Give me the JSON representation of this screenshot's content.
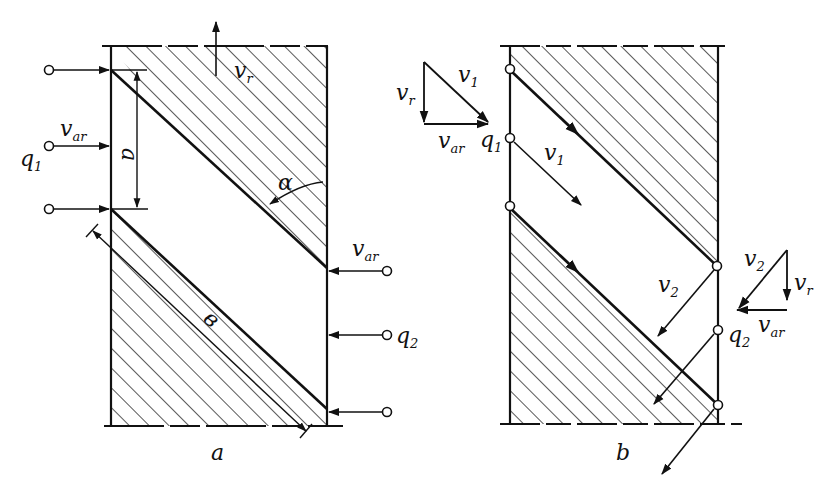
{
  "figure": {
    "panels": [
      {
        "id": "a",
        "caption": "a",
        "labels": {
          "v_r": {
            "base": "v",
            "sub": "r"
          },
          "v_ar_left": {
            "base": "v",
            "sub": "ar"
          },
          "q1": {
            "base": "q",
            "sub": "1"
          },
          "a_dim": "a",
          "alpha": "α",
          "b_dim": "в",
          "v_ar_right": {
            "base": "v",
            "sub": "ar"
          },
          "q2": {
            "base": "q",
            "sub": "2"
          }
        }
      },
      {
        "id": "b",
        "caption": "b",
        "labels": {
          "tri1_v1": {
            "base": "v",
            "sub": "1"
          },
          "tri1_vr": {
            "base": "v",
            "sub": "r"
          },
          "tri1_var": {
            "base": "v",
            "sub": "ar"
          },
          "q1": {
            "base": "q",
            "sub": "1"
          },
          "v1": {
            "base": "v",
            "sub": "1"
          },
          "v2": {
            "base": "v",
            "sub": "2"
          },
          "tri2_v2": {
            "base": "v",
            "sub": "2"
          },
          "tri2_vr": {
            "base": "v",
            "sub": "r"
          },
          "tri2_var": {
            "base": "v",
            "sub": "ar"
          },
          "q2": {
            "base": "q",
            "sub": "2"
          }
        }
      }
    ],
    "colors": {
      "ink": "#111111",
      "background": "#ffffff"
    }
  }
}
